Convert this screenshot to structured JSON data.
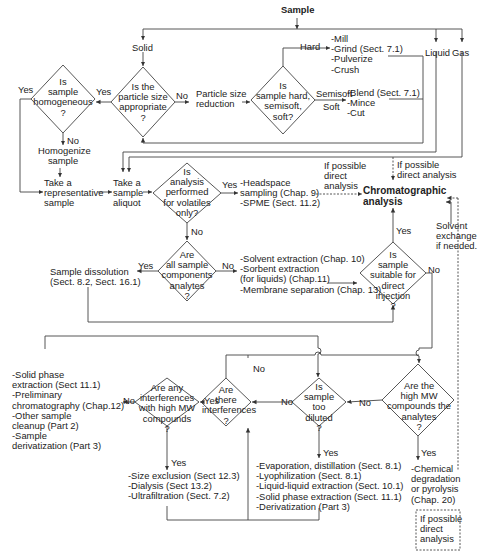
{
  "start": "Sample",
  "branches": {
    "solid": "Solid",
    "liquid": "Liquid",
    "gas": "Gas"
  },
  "decisions": {
    "particle_size": [
      "Is the",
      "particle size",
      "appropriate",
      "?"
    ],
    "homogeneous": [
      "Is",
      "sample",
      "homogeneous",
      "?"
    ],
    "hardness": [
      "Is",
      "sample hard,",
      "semisoft,",
      "soft?"
    ],
    "volatiles": [
      "Is",
      "analysis",
      "performed",
      "for volatiles",
      "only?"
    ],
    "all_analytes": [
      "Are",
      "all sample",
      "components",
      "analytes",
      "?"
    ],
    "direct_injection": [
      "Is",
      "sample",
      "suitable for",
      "direct",
      "injection",
      "?"
    ],
    "high_mw_analytes": [
      "Are the",
      "high MW",
      "compounds the",
      "analytes",
      "?"
    ],
    "too_diluted": [
      "Is",
      "sample",
      "too",
      "diluted",
      "?"
    ],
    "interferences": [
      "Are",
      "there",
      "interferences",
      "?"
    ],
    "high_mw_interferences": [
      "Are any",
      "interferences",
      "with high MW",
      "compounds",
      "?"
    ]
  },
  "processes": {
    "particle_reduction": [
      "Particle size",
      "reduction"
    ],
    "hard_methods": [
      "-Mill",
      "-Grind (Sect. 7.1)",
      "-Pulverize",
      "-Crush"
    ],
    "soft_methods": [
      "-Blend (Sect. 7.1)",
      "-Mince",
      "-Cut"
    ],
    "homogenize": [
      "Homogenize",
      "sample"
    ],
    "representative": [
      "Take a",
      "representative",
      "sample"
    ],
    "aliquot": [
      "Take a",
      "sample",
      "aliquot"
    ],
    "volatile_methods": [
      "-Headspace",
      " sampling (Chap. 9)",
      "-SPME (Sect. 11.2)"
    ],
    "chromatographic": [
      "Chromatographic",
      "analysis"
    ],
    "dissolution": [
      "Sample dissolution",
      "(Sect. 8.2, Sect. 16.1)"
    ],
    "extraction_methods": [
      "-Solvent extraction (Chap. 10)",
      "-Sorbent extraction",
      " (for liquids) (Chap.11)",
      "-Membrane separation (Chap. 13)"
    ],
    "cleanup_methods": [
      "-Solid phase",
      " extraction (Sect 11.1)",
      "-Preliminary",
      " chromatography (Chap.12)",
      "-Other sample",
      " cleanup (Part 2)",
      "-Sample",
      " derivatization (Part 3)"
    ],
    "size_methods": [
      "-Size exclusion (Sect 12.3)",
      "-Dialysis (Sect 13.2)",
      "-Ultrafiltration (Sect. 7.2)"
    ],
    "concentration_methods": [
      "-Evaporation, distillation (Sect. 8.1)",
      "-Lyophilization (Sect. 8.1)",
      "-Liquid-liquid extraction (Sect. 10.1)",
      "-Solid phase extraction (Sect. 11.1)",
      "-Derivatization (Part 3)"
    ],
    "degradation_methods": [
      "-Chemical",
      " degradation",
      " or pyrolysis",
      " (Chap. 20)"
    ]
  },
  "labels": {
    "yes": "Yes",
    "no": "No",
    "hard": "Hard",
    "semisoft": "Semisoft",
    "soft": "Soft",
    "direct_1": [
      "If possible",
      "direct",
      "analysis"
    ],
    "direct_2": [
      "If possible",
      "direct analysis"
    ],
    "direct_3": [
      "If possible",
      "direct",
      "analysis"
    ],
    "solvent_exchange": [
      "Solvent",
      "exchange",
      "if needed."
    ]
  },
  "colors": {
    "line": "#333333",
    "text": "#222222",
    "background": "#ffffff"
  }
}
